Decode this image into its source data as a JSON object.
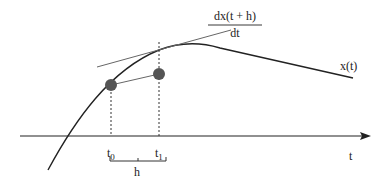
{
  "diagram": {
    "colors": {
      "curve": "#222222",
      "tangent": "#666666",
      "axis": "#222222",
      "point": "#555555",
      "dashed": "#333333",
      "background": "#ffffff"
    },
    "labels": {
      "derivative_numerator": "dx(t + h)",
      "derivative_denominator": "dt",
      "curve_label": "x(t)",
      "axis_label": "t",
      "t0_base": "t",
      "t0_sub": "0",
      "t1_base": "t",
      "t1_sub": "1",
      "step_label": "h"
    }
  }
}
